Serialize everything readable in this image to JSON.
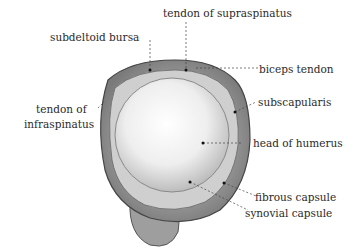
{
  "figure": {
    "labels": {
      "tendon_of_supraspinatus": "tendon of supraspinatus",
      "subdeltoid_bursa": "subdeltoid bursa",
      "biceps_tendon": "biceps tendon",
      "subscapularis": "subscapularis",
      "tendon_of_infraspinatus_line1": "tendon of",
      "tendon_of_infraspinatus_line2": "infraspinatus",
      "head_of_humerus": "head of humerus",
      "fibrous_capsule": "fibrous capsule",
      "synovial_capsule": "synovial capsule"
    }
  }
}
